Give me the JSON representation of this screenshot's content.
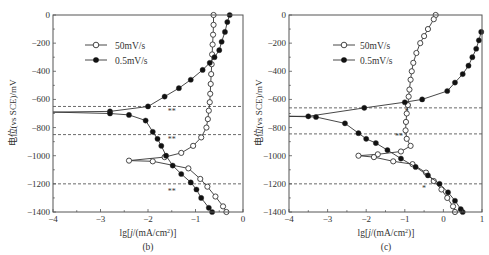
{
  "chart_data": [
    {
      "type": "line",
      "panel_label": "(b)",
      "xlabel": "lg[j/(mA/cm²)]",
      "ylabel": "电位(vs SCE)/mV",
      "xlim": [
        -4,
        0
      ],
      "ylim": [
        -1400,
        0
      ],
      "xticks": [
        "-4",
        "-3",
        "-2",
        "-1",
        "0"
      ],
      "yticks": [
        "0",
        "-200",
        "-400",
        "-600",
        "-800",
        "-1000",
        "-1200",
        "-1400"
      ],
      "legend": [
        "50mV/s",
        "0.5mV/s"
      ],
      "legend_position": "upper-left",
      "grid": false,
      "hlines": [
        -650,
        -850,
        -1200
      ],
      "annotations": [
        {
          "text": "**",
          "x": -1.5,
          "y": -700
        },
        {
          "text": "**",
          "x": -1.5,
          "y": -900
        },
        {
          "text": "**",
          "x": -1.5,
          "y": -1270
        }
      ],
      "series": [
        {
          "name": "50mV/s",
          "marker": "open-circle",
          "points": [
            [
              -0.62,
              0
            ],
            [
              -0.62,
              -70
            ],
            [
              -0.63,
              -140
            ],
            [
              -0.64,
              -210
            ],
            [
              -0.65,
              -280
            ],
            [
              -0.66,
              -350
            ],
            [
              -0.67,
              -420
            ],
            [
              -0.68,
              -490
            ],
            [
              -0.69,
              -560
            ],
            [
              -0.7,
              -620
            ],
            [
              -0.72,
              -680
            ],
            [
              -0.74,
              -740
            ],
            [
              -0.77,
              -800
            ],
            [
              -0.88,
              -870
            ],
            [
              -1.05,
              -930
            ],
            [
              -1.3,
              -980
            ],
            [
              -1.65,
              -1010
            ],
            [
              -2.4,
              -1035
            ],
            [
              -1.9,
              -1040
            ],
            [
              -1.15,
              -1090
            ],
            [
              -0.9,
              -1165
            ],
            [
              -0.75,
              -1220
            ],
            [
              -0.58,
              -1290
            ],
            [
              -0.42,
              -1360
            ],
            [
              -0.35,
              -1400
            ]
          ]
        },
        {
          "name": "0.5mV/s",
          "marker": "filled-circle",
          "points": [
            [
              -0.28,
              0
            ],
            [
              -0.33,
              -50
            ],
            [
              -0.38,
              -120
            ],
            [
              -0.45,
              -190
            ],
            [
              -0.5,
              -250
            ],
            [
              -0.6,
              -300
            ],
            [
              -0.7,
              -340
            ],
            [
              -0.85,
              -390
            ],
            [
              -1.1,
              -460
            ],
            [
              -1.35,
              -520
            ],
            [
              -1.65,
              -580
            ],
            [
              -2.0,
              -650
            ],
            [
              -2.8,
              -685
            ],
            [
              -4,
              -690
            ],
            [
              -2.8,
              -700
            ],
            [
              -2.4,
              -710
            ],
            [
              -2.05,
              -750
            ],
            [
              -1.9,
              -830
            ],
            [
              -1.8,
              -880
            ],
            [
              -1.72,
              -930
            ],
            [
              -1.62,
              -1000
            ],
            [
              -1.48,
              -1070
            ],
            [
              -1.3,
              -1130
            ],
            [
              -1.1,
              -1190
            ],
            [
              -0.98,
              -1240
            ],
            [
              -0.88,
              -1300
            ],
            [
              -0.72,
              -1370
            ],
            [
              -0.65,
              -1400
            ]
          ]
        }
      ]
    },
    {
      "type": "line",
      "panel_label": "(c)",
      "xlabel": "lg[j/(mA/cm²)]",
      "ylabel": "电位(vs SCE)/mV",
      "xlim": [
        -4,
        1
      ],
      "ylim": [
        -1400,
        0
      ],
      "xticks": [
        "-4",
        "-3",
        "-2",
        "-1",
        "0",
        "1"
      ],
      "yticks": [
        "0",
        "-200",
        "-400",
        "-600",
        "-800",
        "-1000",
        "-1200",
        "-1400"
      ],
      "legend": [
        "50mV/s",
        "0.5mV/s"
      ],
      "legend_position": "upper-left",
      "grid": false,
      "hlines": [
        -660,
        -845,
        -1200
      ],
      "annotations": [
        {
          "text": "*",
          "x": -0.95,
          "y": -700
        },
        {
          "text": "**",
          "x": -1.15,
          "y": -880
        },
        {
          "text": "*",
          "x": -0.5,
          "y": -1250
        }
      ],
      "series": [
        {
          "name": "50mV/s",
          "marker": "open-circle",
          "points": [
            [
              -0.2,
              0
            ],
            [
              -0.25,
              -30
            ],
            [
              -0.4,
              -100
            ],
            [
              -0.5,
              -150
            ],
            [
              -0.6,
              -200
            ],
            [
              -0.7,
              -270
            ],
            [
              -0.78,
              -340
            ],
            [
              -0.82,
              -400
            ],
            [
              -0.85,
              -460
            ],
            [
              -0.88,
              -530
            ],
            [
              -0.9,
              -580
            ],
            [
              -0.92,
              -640
            ],
            [
              -0.95,
              -700
            ],
            [
              -0.97,
              -760
            ],
            [
              -0.98,
              -820
            ],
            [
              -0.95,
              -880
            ],
            [
              -0.85,
              -930
            ],
            [
              -1.1,
              -970
            ],
            [
              -1.7,
              -990
            ],
            [
              -2.2,
              -1000
            ],
            [
              -1.8,
              -1010
            ],
            [
              -1.3,
              -1040
            ],
            [
              -0.8,
              -1060
            ],
            [
              -0.45,
              -1120
            ],
            [
              -0.25,
              -1180
            ],
            [
              -0.05,
              -1240
            ],
            [
              0.1,
              -1300
            ],
            [
              0.25,
              -1360
            ],
            [
              0.3,
              -1400
            ]
          ]
        },
        {
          "name": "0.5mV/s",
          "marker": "filled-circle",
          "points": [
            [
              0.98,
              -120
            ],
            [
              0.92,
              -180
            ],
            [
              0.85,
              -240
            ],
            [
              0.75,
              -300
            ],
            [
              0.65,
              -360
            ],
            [
              0.5,
              -420
            ],
            [
              0.3,
              -480
            ],
            [
              0.1,
              -540
            ],
            [
              -0.55,
              -600
            ],
            [
              -1.0,
              -620
            ],
            [
              -2.05,
              -660
            ],
            [
              -3.5,
              -720
            ],
            [
              -4,
              -720
            ],
            [
              -3.3,
              -725
            ],
            [
              -2.55,
              -770
            ],
            [
              -2.2,
              -840
            ],
            [
              -2.0,
              -880
            ],
            [
              -1.75,
              -910
            ],
            [
              -1.45,
              -960
            ],
            [
              -1.1,
              -1020
            ],
            [
              -0.72,
              -1080
            ],
            [
              -0.4,
              -1140
            ],
            [
              -0.1,
              -1200
            ],
            [
              0.12,
              -1260
            ],
            [
              0.3,
              -1320
            ],
            [
              0.45,
              -1380
            ],
            [
              0.5,
              -1400
            ]
          ]
        }
      ]
    }
  ],
  "panels": {
    "b": {
      "label": "(b)",
      "xlabel_prefix": "lg[",
      "xlabel_j": "j",
      "xlabel_mid": "/(mA/cm",
      "xlabel_sup": "2",
      "xlabel_suffix": ")]",
      "ylabel": "电位(vs SCE)/mV",
      "legend": [
        "50mV/s",
        "0.5mV/s"
      ]
    },
    "c": {
      "label": "(c)",
      "xlabel_prefix": "lg[",
      "xlabel_j": "j",
      "xlabel_mid": "/(mA/cm",
      "xlabel_sup": "2",
      "xlabel_suffix": ")]",
      "ylabel": "电位(vs SCE)/mV",
      "legend": [
        "50mV/s",
        "0.5mV/s"
      ]
    }
  }
}
